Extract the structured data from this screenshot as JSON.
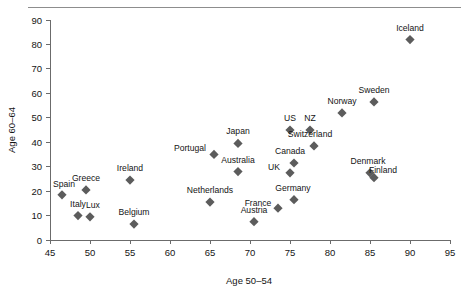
{
  "chart_data": {
    "type": "scatter",
    "title": "",
    "xlabel": "Age 50–54",
    "ylabel": "Age 60–64",
    "xlim": [
      45,
      95
    ],
    "ylim": [
      0,
      90
    ],
    "xticks": [
      45,
      50,
      55,
      60,
      65,
      70,
      75,
      80,
      85,
      90,
      95
    ],
    "yticks": [
      0,
      10,
      20,
      30,
      40,
      50,
      60,
      70,
      80,
      90
    ],
    "grid": false,
    "legend": "none",
    "marker_shape": "diamond",
    "marker_color": "#5c5c5c",
    "points": [
      {
        "label": "Iceland",
        "x": 90.0,
        "y": 82.0,
        "label_dx": 0,
        "label_dy": -9
      },
      {
        "label": "Sweden",
        "x": 85.5,
        "y": 56.5,
        "label_dx": 0,
        "label_dy": -9
      },
      {
        "label": "Norway",
        "x": 81.5,
        "y": 52.0,
        "label_dx": 0,
        "label_dy": -9
      },
      {
        "label": "US",
        "x": 75.0,
        "y": 45.0,
        "label_dx": 0,
        "label_dy": -9
      },
      {
        "label": "NZ",
        "x": 77.5,
        "y": 45.0,
        "label_dx": 0,
        "label_dy": -9
      },
      {
        "label": "Switzerland",
        "x": 78.0,
        "y": 38.5,
        "label_dx": -4,
        "label_dy": -9
      },
      {
        "label": "Japan",
        "x": 68.5,
        "y": 39.5,
        "label_dx": 0,
        "label_dy": -9
      },
      {
        "label": "Portugal",
        "x": 65.5,
        "y": 35.0,
        "label_dx": -24,
        "label_dy": -3
      },
      {
        "label": "Canada",
        "x": 75.5,
        "y": 31.5,
        "label_dx": -4,
        "label_dy": -9
      },
      {
        "label": "Australia",
        "x": 68.5,
        "y": 28.0,
        "label_dx": 0,
        "label_dy": -9
      },
      {
        "label": "UK",
        "x": 75.0,
        "y": 27.5,
        "label_dx": -16,
        "label_dy": -3
      },
      {
        "label": "Denmark",
        "x": 85.0,
        "y": 27.5,
        "label_dx": -2,
        "label_dy": -9
      },
      {
        "label": "Finland",
        "x": 85.5,
        "y": 25.5,
        "label_dx": 9,
        "label_dy": -5
      },
      {
        "label": "Ireland",
        "x": 55.0,
        "y": 24.5,
        "label_dx": 0,
        "label_dy": -9
      },
      {
        "label": "Greece",
        "x": 49.5,
        "y": 20.5,
        "label_dx": 0,
        "label_dy": -9
      },
      {
        "label": "Spain",
        "x": 46.5,
        "y": 18.5,
        "label_dx": 2,
        "label_dy": -8
      },
      {
        "label": "Germany",
        "x": 75.5,
        "y": 16.5,
        "label_dx": -1,
        "label_dy": -9
      },
      {
        "label": "Netherlands",
        "x": 65.0,
        "y": 15.5,
        "label_dx": 0,
        "label_dy": -9
      },
      {
        "label": "France",
        "x": 73.5,
        "y": 13.0,
        "label_dx": -20,
        "label_dy": -2
      },
      {
        "label": "Italy",
        "x": 48.5,
        "y": 10.0,
        "label_dx": 0,
        "label_dy": -9
      },
      {
        "label": "Lux",
        "x": 50.0,
        "y": 9.5,
        "label_dx": 3,
        "label_dy": -9
      },
      {
        "label": "Austria",
        "x": 70.5,
        "y": 7.5,
        "label_dx": 0,
        "label_dy": -9
      },
      {
        "label": "Belgium",
        "x": 55.5,
        "y": 6.5,
        "label_dx": 0,
        "label_dy": -9
      }
    ]
  }
}
